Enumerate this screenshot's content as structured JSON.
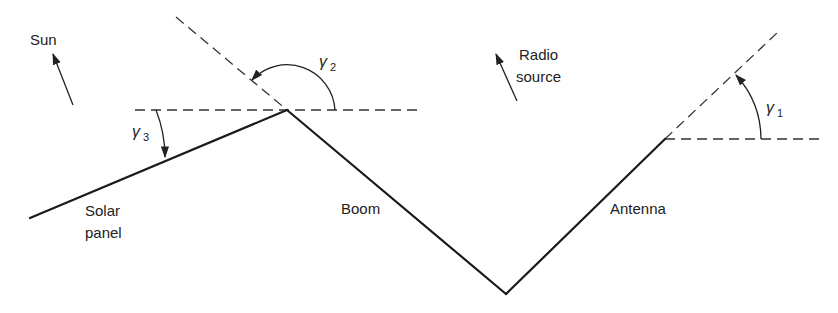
{
  "diagram": {
    "labels": {
      "sun": "Sun",
      "radio_line1": "Radio",
      "radio_line2": "source",
      "solar_line1": "Solar",
      "solar_line2": "panel",
      "boom": "Boom",
      "antenna": "Antenna"
    },
    "angles": [
      {
        "id": "gamma1",
        "symbol": "γ",
        "subscript": "1",
        "description": "angle between horizontal and antenna direction"
      },
      {
        "id": "gamma2",
        "symbol": "γ",
        "subscript": "2",
        "description": "angle between horizontal and boom extension at apex"
      },
      {
        "id": "gamma3",
        "symbol": "γ",
        "subscript": "3",
        "description": "angle between horizontal and solar panel"
      }
    ],
    "components": [
      "Solar panel",
      "Boom",
      "Antenna"
    ],
    "direction_arrows": [
      "Sun",
      "Radio source"
    ],
    "colors": {
      "line": "#1a1a1a",
      "background": "#ffffff"
    }
  }
}
